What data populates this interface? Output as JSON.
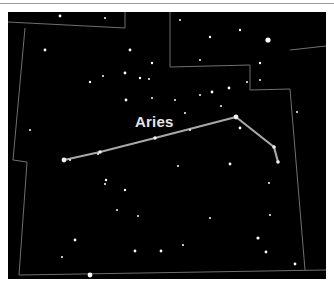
{
  "constellation": {
    "name": "Aries",
    "label_pos": {
      "x": 135,
      "y": 113
    },
    "line_color": "#a8a8a8",
    "line_points": [
      [
        64,
        160
      ],
      [
        100,
        152
      ],
      [
        155,
        138
      ],
      [
        236,
        117
      ],
      [
        274,
        147
      ],
      [
        278,
        162
      ]
    ]
  },
  "colors": {
    "sky": "#000000",
    "boundary": "#7c7c7c",
    "star": "#ffffff",
    "frame": "#ffffff"
  },
  "boundaries": [
    [
      [
        8,
        22
      ],
      [
        125,
        28
      ],
      [
        125,
        12
      ]
    ],
    [
      [
        25,
        28
      ],
      [
        13,
        160
      ],
      [
        27,
        162
      ],
      [
        19,
        275
      ],
      [
        326,
        270
      ]
    ],
    [
      [
        170,
        12
      ],
      [
        170,
        67
      ],
      [
        250,
        65
      ],
      [
        250,
        90
      ],
      [
        290,
        89
      ],
      [
        305,
        270
      ]
    ],
    [
      [
        290,
        50
      ],
      [
        326,
        46
      ]
    ]
  ],
  "stars": [
    [
      60,
      16,
      1.4
    ],
    [
      105,
      18,
      1.0
    ],
    [
      180,
      20,
      1.0
    ],
    [
      240,
      30,
      1.2
    ],
    [
      268,
      40,
      2.6
    ],
    [
      210,
      37,
      1.2
    ],
    [
      45,
      50,
      1.4
    ],
    [
      130,
      50,
      1.4
    ],
    [
      103,
      76,
      1.0
    ],
    [
      152,
      63,
      1.2
    ],
    [
      200,
      60,
      1.0
    ],
    [
      260,
      63,
      1.2
    ],
    [
      125,
      73,
      1.4
    ],
    [
      140,
      78,
      1.2
    ],
    [
      149,
      79,
      1.0
    ],
    [
      90,
      82,
      1.2
    ],
    [
      126,
      100,
      1.4
    ],
    [
      175,
      100,
      1.0
    ],
    [
      212,
      92,
      1.4
    ],
    [
      229,
      88,
      1.4
    ],
    [
      247,
      82,
      1.0
    ],
    [
      260,
      80,
      1.0
    ],
    [
      152,
      98,
      1.0
    ],
    [
      185,
      113,
      1.0
    ],
    [
      240,
      128,
      1.4
    ],
    [
      297,
      112,
      1.0
    ],
    [
      200,
      95,
      1.0
    ],
    [
      221,
      106,
      1.0
    ],
    [
      30,
      130,
      1.0
    ],
    [
      98,
      154,
      1.0
    ],
    [
      70,
      160,
      1.0
    ],
    [
      106,
      180,
      1.2
    ],
    [
      105,
      184,
      1.0
    ],
    [
      125,
      190,
      1.2
    ],
    [
      117,
      210,
      1.0
    ],
    [
      138,
      216,
      1.0
    ],
    [
      75,
      240,
      1.4
    ],
    [
      62,
      257,
      1.0
    ],
    [
      135,
      251,
      1.4
    ],
    [
      161,
      251,
      1.4
    ],
    [
      230,
      164,
      1.4
    ],
    [
      269,
      183,
      1.0
    ],
    [
      258,
      238,
      1.6
    ],
    [
      266,
      252,
      1.4
    ],
    [
      295,
      264,
      1.4
    ],
    [
      183,
      245,
      1.0
    ],
    [
      90,
      275,
      2.4
    ],
    [
      190,
      130,
      1.0
    ],
    [
      270,
      215,
      1.0
    ],
    [
      210,
      218,
      1.0
    ],
    [
      178,
      166,
      1.0
    ]
  ]
}
